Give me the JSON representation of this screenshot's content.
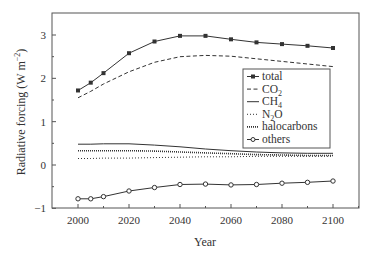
{
  "chart_data": {
    "type": "line",
    "title": "",
    "xlabel": "Year",
    "ylabel": "Radiative forcing (W m⁻²)",
    "xlim": [
      1990,
      2110
    ],
    "ylim": [
      -1,
      3.5
    ],
    "xticks": [
      2000,
      2020,
      2040,
      2060,
      2080,
      2100
    ],
    "yticks": [
      -1,
      0,
      1,
      2,
      3
    ],
    "grid": false,
    "legend_position": "inside-right",
    "x": [
      2000,
      2005,
      2010,
      2020,
      2030,
      2040,
      2050,
      2060,
      2070,
      2080,
      2090,
      2100
    ],
    "series": [
      {
        "name": "total",
        "style": "solid-square-markers",
        "values": [
          1.72,
          1.9,
          2.12,
          2.58,
          2.85,
          2.98,
          2.98,
          2.9,
          2.83,
          2.79,
          2.75,
          2.7
        ]
      },
      {
        "name": "CO2",
        "style": "dashed",
        "values": [
          1.55,
          1.7,
          1.87,
          2.15,
          2.37,
          2.5,
          2.53,
          2.51,
          2.45,
          2.39,
          2.33,
          2.27
        ]
      },
      {
        "name": "CH4",
        "style": "solid",
        "values": [
          0.48,
          0.48,
          0.49,
          0.49,
          0.46,
          0.42,
          0.37,
          0.33,
          0.3,
          0.28,
          0.27,
          0.27
        ]
      },
      {
        "name": "N2O",
        "style": "dotted",
        "values": [
          0.15,
          0.15,
          0.16,
          0.16,
          0.17,
          0.18,
          0.19,
          0.19,
          0.2,
          0.2,
          0.2,
          0.2
        ]
      },
      {
        "name": "halocarbons",
        "style": "dense-dotted",
        "values": [
          0.33,
          0.33,
          0.33,
          0.33,
          0.32,
          0.3,
          0.28,
          0.26,
          0.24,
          0.23,
          0.22,
          0.22
        ]
      },
      {
        "name": "others",
        "style": "solid-open-circle-markers",
        "values": [
          -0.78,
          -0.78,
          -0.73,
          -0.6,
          -0.52,
          -0.45,
          -0.44,
          -0.46,
          -0.45,
          -0.42,
          -0.4,
          -0.37
        ]
      }
    ]
  },
  "axes": {
    "xlabel": "Year",
    "ylabel_main": "Radiative forcing (W m",
    "ylabel_sup": "−2",
    "ylabel_close": ")",
    "xtick_labels": [
      "2000",
      "2020",
      "2040",
      "2060",
      "2080",
      "2100"
    ],
    "ytick_labels": [
      "3",
      "2",
      "1",
      "0",
      "−1"
    ]
  },
  "legend": {
    "items": [
      {
        "label": "total",
        "sub": ""
      },
      {
        "label": "CO",
        "sub": "2"
      },
      {
        "label": "CH",
        "sub": "4"
      },
      {
        "label": "N",
        "sub": "2",
        "suffix": "O"
      },
      {
        "label": "halocarbons",
        "sub": ""
      },
      {
        "label": "others",
        "sub": ""
      }
    ]
  },
  "colors": {
    "line": "#333333",
    "frame": "#555555"
  }
}
